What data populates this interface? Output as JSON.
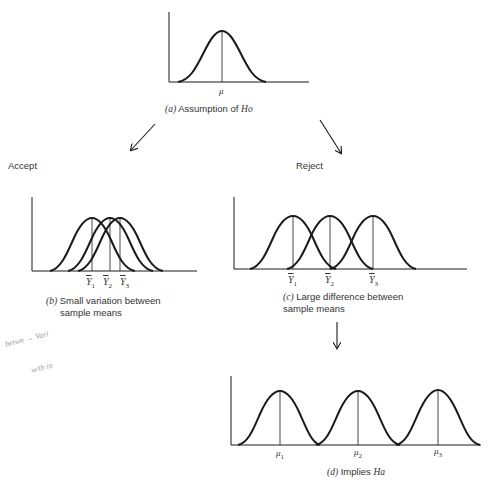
{
  "panels": {
    "a": {
      "caption_prefix": "(a)",
      "caption_text": "Assumption of",
      "caption_hyp": "Ho",
      "mean_label": "μ",
      "curves": [
        {
          "peak_x": 222
        }
      ]
    },
    "b": {
      "caption_prefix": "(b)",
      "caption_line1": "Small variation between",
      "caption_line2": "sample means",
      "labels": [
        {
          "sym": "Y",
          "sub": "1"
        },
        {
          "sym": "Y",
          "sub": "2"
        },
        {
          "sym": "Y",
          "sub": "3"
        }
      ]
    },
    "c": {
      "caption_prefix": "(c)",
      "caption_line1": "Large difference between",
      "caption_line2": "sample means",
      "labels": [
        {
          "sym": "Y",
          "sub": "1"
        },
        {
          "sym": "Y",
          "sub": "2"
        },
        {
          "sym": "Y",
          "sub": "3"
        }
      ]
    },
    "d": {
      "caption_prefix": "(d)",
      "caption_text": "Implies",
      "caption_hyp": "Ha",
      "labels": [
        {
          "sym": "μ",
          "sub": "1"
        },
        {
          "sym": "μ",
          "sub": "2"
        },
        {
          "sym": "μ",
          "sub": "3"
        }
      ]
    }
  },
  "branches": {
    "accept": "Accept",
    "reject": "Reject"
  },
  "annotation": {
    "line1": "betwn  → Vari",
    "line2": "w/th in"
  },
  "colors": {
    "ink": "#1a1a1a",
    "text": "#333333",
    "pencil": "#9a9a9a"
  }
}
